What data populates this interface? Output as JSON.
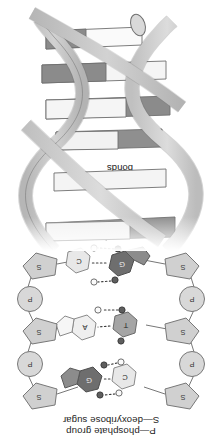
{
  "figure": {
    "orientation": "rotated-180",
    "legend": {
      "phosphate": "P—phosphate group",
      "sugar": "S—deoxyribose sugar"
    },
    "annotation": {
      "hydrogen_bonds_line1": "Hydrogen",
      "hydrogen_bonds_line2": "bonds"
    },
    "backbone": {
      "sugar_symbol": "S",
      "phosphate_symbol": "P",
      "left_units": [
        "S",
        "P",
        "S",
        "P",
        "S"
      ],
      "right_units": [
        "S",
        "P",
        "S",
        "P",
        "S"
      ]
    },
    "base_pairs": [
      {
        "left_base": "C",
        "right_base": "G",
        "left_type": "pyrimidine",
        "right_type": "purine",
        "hydrogen_bonds": 3
      },
      {
        "left_base": "T",
        "right_base": "A",
        "left_type": "pyrimidine",
        "right_type": "purine",
        "hydrogen_bonds": 2
      },
      {
        "left_base": "G",
        "right_base": "C",
        "left_type": "purine",
        "right_type": "pyrimidine",
        "hydrogen_bonds": 3
      }
    ],
    "helix": {
      "strand_count": 2,
      "rung_count": 6,
      "description": "double helix with ladder rungs"
    },
    "colors": {
      "sugar_fill": "#cfcfcf",
      "phosphate_fill": "#d6d6d6",
      "purine_dark": "#7b7b7b",
      "purine_darker": "#6a6a6a",
      "pyrimidine_light": "#e2e2e2",
      "pyrimidine_mid": "#a8a8a8",
      "ribbon_fill": "#cccccc",
      "ribbon_fill_back": "#bdbdbd",
      "rung_light": "#f1f1f1",
      "rung_dark": "#8a8a8a",
      "outline": "#6f6f6f",
      "text": "#1b1b1b"
    }
  }
}
